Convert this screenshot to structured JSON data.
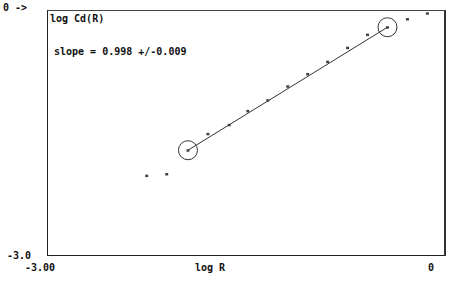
{
  "chart_data": {
    "type": "scatter",
    "title": "",
    "ylabel": "log Cd(R)",
    "xlabel": "log R",
    "annotation": "slope = 0.998 +/-0.009",
    "y_top_label": "0 ->",
    "y_bottom_label": "-3.0",
    "x_left_label": "-3.00",
    "x_right_label": "0",
    "xlim": [
      -3.0,
      0.0
    ],
    "ylim": [
      -3.0,
      0.0
    ],
    "grid": false,
    "points": [
      {
        "x": -2.25,
        "y": -2.02
      },
      {
        "x": -2.1,
        "y": -2.0
      },
      {
        "x": -1.94,
        "y": -1.71
      },
      {
        "x": -1.79,
        "y": -1.51
      },
      {
        "x": -1.63,
        "y": -1.4
      },
      {
        "x": -1.49,
        "y": -1.23
      },
      {
        "x": -1.34,
        "y": -1.1
      },
      {
        "x": -1.19,
        "y": -0.93
      },
      {
        "x": -1.04,
        "y": -0.78
      },
      {
        "x": -0.89,
        "y": -0.63
      },
      {
        "x": -0.74,
        "y": -0.46
      },
      {
        "x": -0.59,
        "y": -0.3
      },
      {
        "x": -0.44,
        "y": -0.21
      },
      {
        "x": -0.29,
        "y": -0.11
      },
      {
        "x": -0.14,
        "y": -0.04
      }
    ],
    "fit_line": {
      "x_start": -1.94,
      "y_start": -1.71,
      "x_end": -0.44,
      "y_end": -0.21
    },
    "circled_points": [
      2,
      12
    ]
  }
}
